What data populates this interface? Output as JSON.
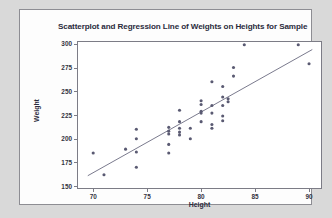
{
  "chart_data": {
    "type": "scatter",
    "title": "Scatterplot and Regression Line of Weights on Heights for Sample",
    "xlabel": "Height",
    "ylabel": "Weight",
    "xlim": [
      68.5,
      91.2
    ],
    "ylim": [
      147,
      303
    ],
    "xticks": [
      70,
      75,
      80,
      85,
      90
    ],
    "yticks": [
      150,
      175,
      200,
      225,
      250,
      275,
      300
    ],
    "grid": false,
    "legend": "none",
    "marker_color": "#5a5a72",
    "line_color": "#6b6b80",
    "points": [
      {
        "x": 70.0,
        "y": 185
      },
      {
        "x": 71.0,
        "y": 162
      },
      {
        "x": 73.0,
        "y": 189
      },
      {
        "x": 74.0,
        "y": 210
      },
      {
        "x": 74.0,
        "y": 200
      },
      {
        "x": 74.0,
        "y": 186
      },
      {
        "x": 74.0,
        "y": 170
      },
      {
        "x": 77.0,
        "y": 212
      },
      {
        "x": 77.0,
        "y": 208
      },
      {
        "x": 77.0,
        "y": 205
      },
      {
        "x": 77.0,
        "y": 194
      },
      {
        "x": 77.0,
        "y": 185
      },
      {
        "x": 78.0,
        "y": 230
      },
      {
        "x": 78.0,
        "y": 218
      },
      {
        "x": 78.0,
        "y": 211
      },
      {
        "x": 78.0,
        "y": 207
      },
      {
        "x": 78.0,
        "y": 204
      },
      {
        "x": 79.0,
        "y": 211
      },
      {
        "x": 79.0,
        "y": 200
      },
      {
        "x": 80.0,
        "y": 240
      },
      {
        "x": 80.0,
        "y": 236
      },
      {
        "x": 80.0,
        "y": 229
      },
      {
        "x": 80.0,
        "y": 227
      },
      {
        "x": 80.0,
        "y": 218
      },
      {
        "x": 81.0,
        "y": 260
      },
      {
        "x": 81.0,
        "y": 235
      },
      {
        "x": 81.0,
        "y": 227
      },
      {
        "x": 81.0,
        "y": 215
      },
      {
        "x": 81.0,
        "y": 211
      },
      {
        "x": 82.0,
        "y": 255
      },
      {
        "x": 82.0,
        "y": 244
      },
      {
        "x": 82.0,
        "y": 235
      },
      {
        "x": 82.0,
        "y": 224
      },
      {
        "x": 82.0,
        "y": 219
      },
      {
        "x": 82.5,
        "y": 242
      },
      {
        "x": 82.5,
        "y": 239
      },
      {
        "x": 83.0,
        "y": 275
      },
      {
        "x": 83.0,
        "y": 266
      },
      {
        "x": 84.0,
        "y": 299
      },
      {
        "x": 89.0,
        "y": 299
      },
      {
        "x": 90.0,
        "y": 279
      }
    ],
    "regression_line": {
      "x_start": 69.5,
      "y_start": 161,
      "x_end": 90.3,
      "y_end": 294
    }
  }
}
